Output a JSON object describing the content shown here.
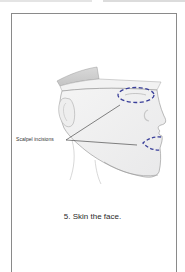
{
  "figure": {
    "label": "Scalpel incisions",
    "caption": "5. Skin the face.",
    "incision_color": "#3a3f9a",
    "line_color": "#333333"
  }
}
